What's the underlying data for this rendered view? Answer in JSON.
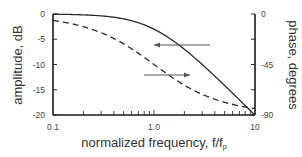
{
  "chart_data": {
    "type": "line",
    "title": "",
    "xlabel": "normalized frequency, f/f",
    "xlabel_subscript": "p",
    "ylabel_left": "amplitude, dB",
    "ylabel_right": "phase, degrees",
    "xscale": "log",
    "xlim": [
      0.1,
      10
    ],
    "ylim_left": [
      -20,
      0
    ],
    "ylim_right": [
      -90,
      0
    ],
    "x_tick_labels": [
      "0.1",
      "1.0",
      "10"
    ],
    "y_left_tick_labels": [
      "0",
      "-5",
      "-10",
      "-15",
      "-20"
    ],
    "y_left_ticks": [
      0,
      -5,
      -10,
      -15,
      -20
    ],
    "y_right_tick_labels": [
      "0",
      "-45",
      "-90"
    ],
    "y_right_ticks": [
      0,
      -22.5,
      -45,
      -67.5,
      -90
    ],
    "grid": false,
    "legend": "none (arrows indicate axis association)",
    "series": [
      {
        "name": "amplitude",
        "axis": "left",
        "style": "solid",
        "x": [
          0.1,
          0.2,
          0.3,
          0.5,
          0.7,
          1.0,
          1.5,
          2.0,
          3.0,
          5.0,
          7.0,
          10.0
        ],
        "values": [
          -0.04,
          -0.17,
          -0.37,
          -0.97,
          -1.74,
          -3.01,
          -5.12,
          -6.99,
          -10.0,
          -14.15,
          -17.0,
          -20.04
        ]
      },
      {
        "name": "phase",
        "axis": "right",
        "style": "dashed",
        "x": [
          0.1,
          0.2,
          0.3,
          0.5,
          0.7,
          1.0,
          1.5,
          2.0,
          3.0,
          5.0,
          7.0,
          10.0
        ],
        "values": [
          -5.7,
          -11.3,
          -16.7,
          -26.6,
          -35.0,
          -45.0,
          -56.3,
          -63.4,
          -71.6,
          -78.7,
          -81.9,
          -84.3
        ]
      }
    ],
    "annotations": [
      {
        "type": "arrow",
        "direction": "left",
        "near_series": "amplitude",
        "meaning": "refers to left amplitude axis"
      },
      {
        "type": "arrow",
        "direction": "right",
        "near_series": "phase",
        "meaning": "refers to right phase axis"
      }
    ]
  },
  "colors": {
    "axis": "#1a1a1a",
    "curve": "#2a2a2a",
    "arrow": "#555555",
    "text": "#333333"
  }
}
